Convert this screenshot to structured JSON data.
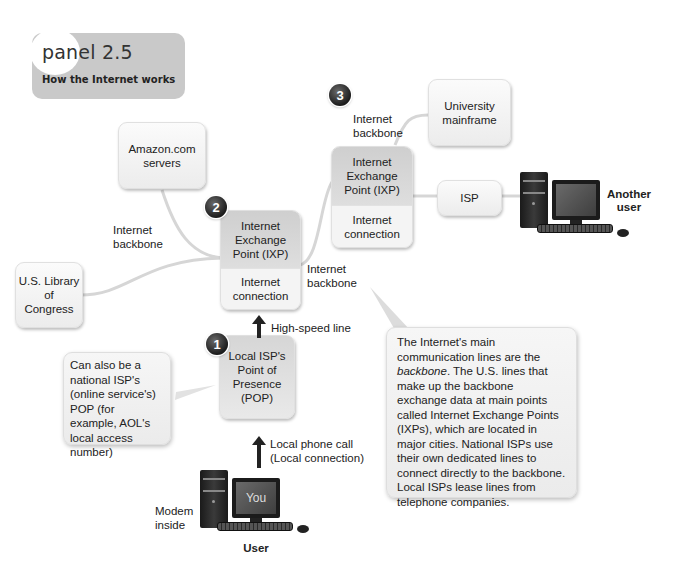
{
  "panel": {
    "title": "panel 2.5",
    "subtitle": "How the Internet works"
  },
  "nodes": {
    "amazon": "Amazon.com servers",
    "library": {
      "line1": "U.S. Library",
      "line2": "of",
      "line3": "Congress"
    },
    "ixp2": {
      "top": "Internet Exchange Point (IXP)",
      "bottom": "Internet connection"
    },
    "ixp3": {
      "top": "Internet Exchange Point (IXP)",
      "bottom": "Internet connection"
    },
    "university": "University mainframe",
    "isp": "ISP",
    "pop": "Local ISP's Point of Presence (POP)"
  },
  "badges": [
    "1",
    "2",
    "3"
  ],
  "labels": {
    "backbone_left": "Internet backbone",
    "backbone_mid": "Internet backbone",
    "backbone_top": "Internet backbone",
    "high_speed": "High-speed line",
    "local_call_1": "Local phone call",
    "local_call_2": "(Local connection)",
    "modem": "Modem inside",
    "user": "User",
    "screen": "You",
    "another_user": "Another user"
  },
  "callouts": {
    "pop_note": "Can also be a national ISP's (online service's) POP (for example, AOL's local access number)",
    "backbone_note": {
      "part1": "The Internet's main communication lines are the ",
      "italic": "backbone",
      "part2": ". The U.S. lines that make up the backbone exchange data at main points called Internet Exchange Points (IXPs), which are located in major cities. National ISPs use their own dedicated lines to connect directly to the backbone. Local ISPs lease lines from telephone companies."
    }
  },
  "colors": {
    "header_bg": "#c9c9c9",
    "box_bg": "#f2f2f2",
    "ixp_top": "#d4d4d4",
    "badge": "#222222",
    "line": "#d8d8d8"
  }
}
